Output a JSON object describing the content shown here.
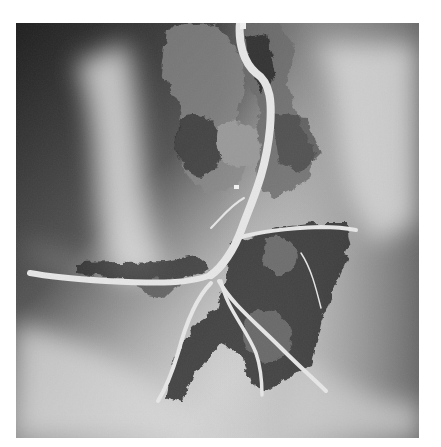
{
  "image": {
    "description": "Grayscale aerial photograph of a bird's-foot river delta with a main channel branching into distributary passes",
    "frame": {
      "x": 16,
      "y": 23,
      "width": 403,
      "height": 415
    },
    "colors": {
      "page_background": "#ffffff",
      "water_light": "#d6d6d6",
      "water_mid": "#b8b8b8",
      "water_dark": "#3a3a3a",
      "land_dark": "#2b2b2b",
      "channel": "#e4e4e4"
    },
    "features": [
      {
        "name": "main-river-channel",
        "label": ""
      },
      {
        "name": "southwest-pass",
        "label": ""
      },
      {
        "name": "east-pass",
        "label": ""
      },
      {
        "name": "south-pass",
        "label": ""
      },
      {
        "name": "southeast-pass",
        "label": ""
      },
      {
        "name": "southwest-lower-pass",
        "label": ""
      }
    ]
  }
}
